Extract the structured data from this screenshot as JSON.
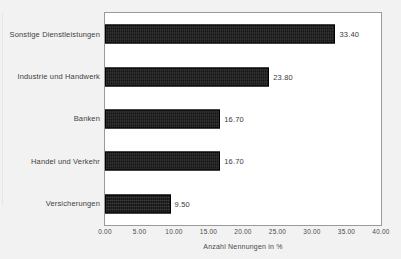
{
  "title_fragment": "",
  "chart_data": {
    "type": "bar",
    "orientation": "horizontal",
    "title": "",
    "subtitle": "",
    "xlabel": "Anzahl Nennungen in %",
    "ylabel": "",
    "xlim": [
      0,
      40
    ],
    "grid": false,
    "legend": null,
    "categories": [
      "Sonstige Dienstleistungen",
      "Industrie und Handwerk",
      "Banken",
      "Handel und Verkehr",
      "Versicherungen"
    ],
    "values": [
      33.4,
      23.8,
      16.7,
      16.7,
      9.5
    ],
    "value_labels": [
      "33.40",
      "23.80",
      "16.70",
      "16.70",
      "9.50"
    ],
    "xticks": [
      0,
      5,
      10,
      15,
      20,
      25,
      30,
      35,
      40
    ],
    "xtick_labels": [
      "0.00",
      "5.00",
      "10.00",
      "15.00",
      "20.00",
      "25.00",
      "30.00",
      "35.00",
      "40.00"
    ],
    "bar_color": "#151515",
    "plot_background": "#ffffff",
    "figure_background": "#f2f2f2",
    "frame_color": "#9a9a9a"
  }
}
